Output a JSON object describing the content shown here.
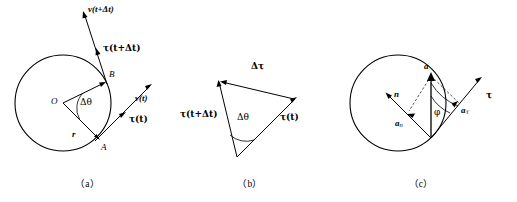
{
  "figure": {
    "type": "physics-vector-diagram",
    "background_color": "#ffffff",
    "stroke_color": "#000000"
  },
  "panels": [
    {
      "id": "a",
      "caption": "（a）",
      "labels": {
        "velocity_next": "v(t+Δt)",
        "tau_next": "τ(t+Δt)",
        "point_b": "B",
        "center": "O",
        "delta_theta": "Δθ",
        "radius": "r",
        "point_a": "A",
        "velocity_now": "v(t)",
        "tau_now": "τ(t)"
      }
    },
    {
      "id": "b",
      "caption": "（b）",
      "labels": {
        "delta_tau": "Δτ",
        "tau_next": "τ(t+Δt)",
        "delta_theta": "Δθ",
        "tau_now": "τ(t)"
      }
    },
    {
      "id": "c",
      "caption": "（c）",
      "labels": {
        "acceleration": "a",
        "normal_unit": "n",
        "normal_component": "a",
        "normal_component_sub": "n",
        "tangential_component": "a",
        "tangential_component_sub": "τ",
        "tau": "τ",
        "phi": "φ"
      }
    }
  ]
}
